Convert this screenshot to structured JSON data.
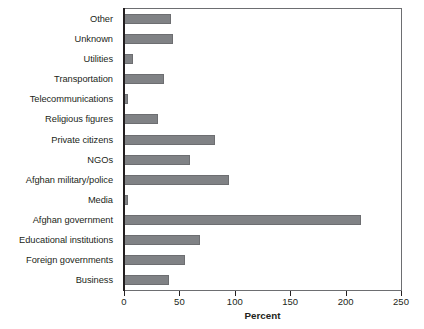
{
  "chart_data": {
    "type": "bar",
    "orientation": "horizontal",
    "title": "",
    "xlabel": "Percent",
    "ylabel": "",
    "xlim": [
      0,
      250
    ],
    "xticks": [
      0,
      50,
      100,
      150,
      200,
      250
    ],
    "grid": false,
    "legend": null,
    "bar_color": "#808285",
    "bar_edge_color": "#6d6e71",
    "axis_color": "#231f20",
    "categories": [
      "Other",
      "Unknown",
      "Utilities",
      "Transportation",
      "Telecommunications",
      "Religious figures",
      "Private citizens",
      "NGOs",
      "Afghan military/police",
      "Media",
      "Afghan government",
      "Educational institutions",
      "Foreign governments",
      "Business"
    ],
    "values": [
      42,
      44,
      8,
      36,
      4,
      31,
      82,
      60,
      95,
      4,
      214,
      69,
      55,
      41
    ]
  }
}
